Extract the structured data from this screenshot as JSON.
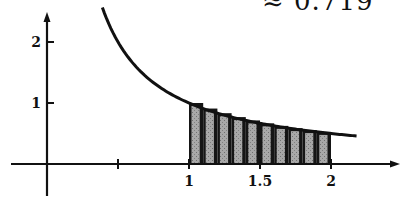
{
  "header": {
    "approx_text": "≈ 0.719"
  },
  "axes": {
    "x_ticks": [
      {
        "value": 0.5,
        "label": ""
      },
      {
        "value": 1,
        "label": "1"
      },
      {
        "value": 1.5,
        "label": "1.5"
      },
      {
        "value": 2,
        "label": "2"
      }
    ],
    "y_ticks": [
      {
        "value": 1,
        "label": "1"
      },
      {
        "value": 2,
        "label": "2"
      }
    ]
  },
  "chart_data": {
    "type": "area",
    "title": "≈ 0.719",
    "function": "1/x",
    "curve_x_range": [
      0.39,
      2.18
    ],
    "interval": [
      1,
      2
    ],
    "n_rectangles": 10,
    "rectangles": [
      {
        "x0": 1.0,
        "x1": 1.1,
        "height": 1.0
      },
      {
        "x0": 1.1,
        "x1": 1.2,
        "height": 0.909
      },
      {
        "x0": 1.2,
        "x1": 1.3,
        "height": 0.833
      },
      {
        "x0": 1.3,
        "x1": 1.4,
        "height": 0.769
      },
      {
        "x0": 1.4,
        "x1": 1.5,
        "height": 0.714
      },
      {
        "x0": 1.5,
        "x1": 1.6,
        "height": 0.667
      },
      {
        "x0": 1.6,
        "x1": 1.7,
        "height": 0.625
      },
      {
        "x0": 1.7,
        "x1": 1.8,
        "height": 0.588
      },
      {
        "x0": 1.8,
        "x1": 1.9,
        "height": 0.556
      },
      {
        "x0": 1.9,
        "x1": 2.0,
        "height": 0.526
      }
    ],
    "x_tick_labels": [
      "1",
      "1.5",
      "2"
    ],
    "y_tick_labels": [
      "1",
      "2"
    ],
    "xlim": [
      -0.3,
      2.5
    ],
    "ylim": [
      -0.5,
      2.5
    ],
    "grid": false,
    "legend": null,
    "annotation": "≈ 0.719",
    "colors": {
      "curve": "#111111",
      "rect_fill": "#9a9a9a",
      "rect_edge": "#111111"
    }
  }
}
